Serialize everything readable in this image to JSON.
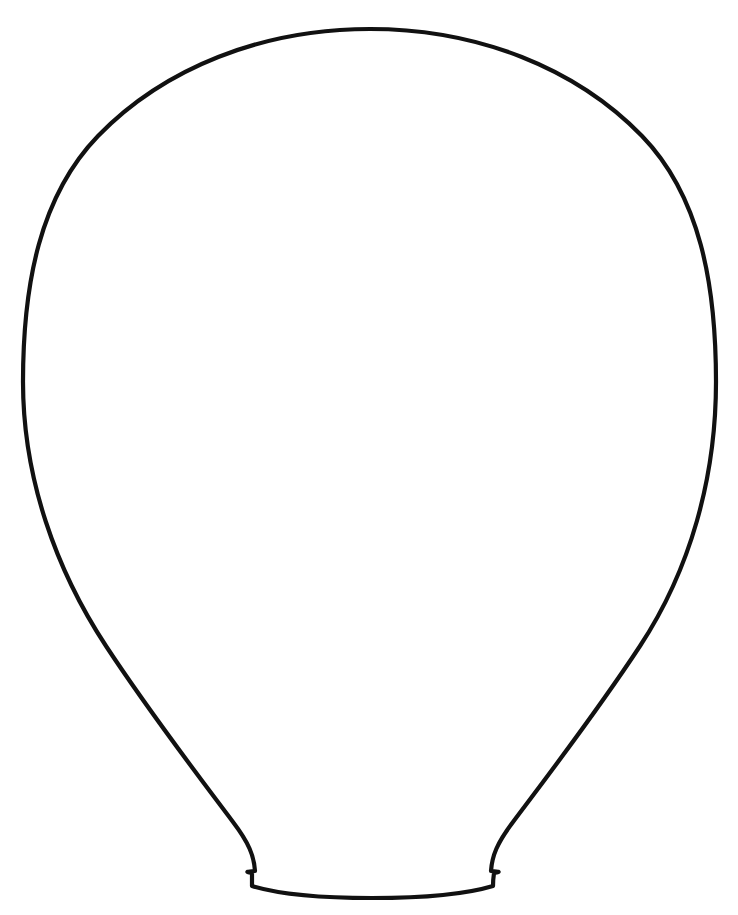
{
  "page": {
    "background_color": "#ffffff",
    "width": 738,
    "height": 915,
    "document_type": "printable coloring page / craft template"
  },
  "header": {
    "clipped_text_left": "",
    "clipped_text_right": "page",
    "note": "text is cropped off the top edge of the page and only faint glyph bottoms remain",
    "color": "#c9c9cf"
  },
  "artwork": {
    "name": "balloon",
    "alt_reading": "light bulb / hot-air-balloon envelope outline",
    "fill_color": "#ffffff",
    "stroke_color": "#111111",
    "stroke_width": 4.2,
    "geometry": {
      "apex": [
        370,
        29
      ],
      "left_extremity": [
        23,
        415
      ],
      "right_extremity": [
        716,
        425
      ],
      "neck_left": [
        256,
        870
      ],
      "neck_right": [
        490,
        870
      ],
      "base_y": 893,
      "base_left_x": 252,
      "base_right_x": 493,
      "body_width": 693,
      "body_height": 864,
      "neck_width": 241
    },
    "outline_path": "M 370 29 C 478 29 576 68 642 136 C 700 196 716 284 716 382 C 716 478 690 570 640 646 C 596 713 546 778 513 822 C 497 843 492 856 491 871 C 504 872 497 872 494 873 C 494 873 493 880 493 886 C 460 896 414 898 372 898 C 330 898 285 896 252 886 C 252 880 252 873 252 873 C 249 872 242 872 255 871 C 254 856 249 843 233 822 C 200 778 150 713 106 646 C 56 570 23 478 23 382 C 23 284 40 196 98 136 C 164 68 262 29 370 29 Z"
  }
}
